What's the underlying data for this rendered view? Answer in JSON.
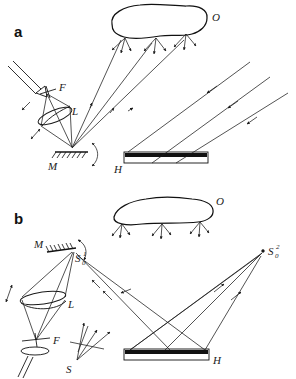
{
  "figure": {
    "caption_panels": [
      "a",
      "b"
    ],
    "background_color": "#ffffff",
    "ink_color": "#1a1a1a"
  },
  "panel_a": {
    "letter": "a",
    "labels": {
      "object": "O",
      "filter": "F",
      "lens": "L",
      "mirror": "M",
      "hologram": "H"
    },
    "elements": [
      "laser-beam-input",
      "filter-F",
      "lens-L",
      "rotating-mirror-M",
      "object-O",
      "hologram-plate-H",
      "object-beams",
      "reference-beams"
    ]
  },
  "panel_b": {
    "letter": "b",
    "labels": {
      "object": "O",
      "mirror": "M",
      "source_image_1": "S",
      "source_image_1_sub": "0",
      "source_image_1_sup": "1",
      "source_image_2": "S",
      "source_image_2_sub": "0",
      "source_image_2_sup": "2",
      "lens": "L",
      "filter": "F",
      "source": "S",
      "hologram": "H"
    },
    "elements": [
      "laser-beam-input",
      "filter-F",
      "lens-L",
      "rotating-mirror-M",
      "virtual-source-S01",
      "virtual-source-S02",
      "real-source-S",
      "object-O",
      "hologram-plate-H",
      "reconstruction-beams"
    ]
  }
}
